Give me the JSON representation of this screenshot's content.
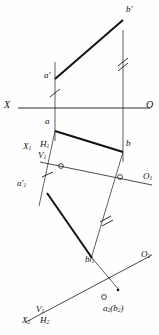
{
  "figure": {
    "type": "descriptive-geometry-projection",
    "title": "",
    "stroke_color": "#1a1a1a",
    "background_color": "#fefefe"
  },
  "axes": {
    "primary": {
      "left_label": "X",
      "right_label": "O",
      "x1": 18,
      "y1": 108,
      "x2": 150,
      "y2": 108
    },
    "aux1": {
      "origin_label": "X",
      "origin_sub": "1",
      "plane_upper": "H",
      "plane_upper_sub": "1",
      "plane_lower": "V",
      "plane_lower_sub": "1",
      "far_label": "O",
      "far_sub": "1",
      "x1": 40,
      "y1": 162,
      "x2": 152,
      "y2": 185
    },
    "aux2": {
      "origin_label": "X",
      "origin_sub": "2",
      "plane_upper": "V",
      "plane_upper_sub": "1",
      "plane_lower": "H",
      "plane_lower_sub": "2",
      "far_label": "O",
      "far_sub": "2",
      "x1": 26,
      "y1": 322,
      "x2": 152,
      "y2": 255
    }
  },
  "points": [
    {
      "id": "a-front",
      "label": "a",
      "prime": "'",
      "sub": "",
      "x": 55,
      "y": 79,
      "lx": 44,
      "ly": 72
    },
    {
      "id": "b-front",
      "label": "b",
      "prime": "'",
      "sub": "",
      "x": 123,
      "y": 20,
      "lx": 127,
      "ly": 6
    },
    {
      "id": "a-top",
      "label": "a",
      "prime": "",
      "sub": "",
      "x": 55,
      "y": 131,
      "lx": 45,
      "ly": 118
    },
    {
      "id": "b-top",
      "label": "b",
      "prime": "",
      "sub": "",
      "x": 123,
      "y": 152,
      "lx": 126,
      "ly": 140
    },
    {
      "id": "a1-aux",
      "label": "a",
      "prime": "'",
      "sub": "1",
      "x": 47,
      "y": 193,
      "lx": 20,
      "ly": 180
    },
    {
      "id": "b1-aux",
      "label": "b",
      "prime": "'",
      "sub": "1",
      "x": 92,
      "y": 258,
      "lx": 86,
      "ly": 255
    },
    {
      "id": "ab2-aux",
      "label": "a",
      "prime": "",
      "sub": "2",
      "paren_label": "b",
      "paren_sub": "2",
      "x": 113,
      "y": 295,
      "lx": 104,
      "ly": 305
    }
  ],
  "segments": [
    {
      "id": "front-view-line",
      "name": "a'b'",
      "x1": 55,
      "y1": 79,
      "x2": 123,
      "y2": 20,
      "weight": "heavy"
    },
    {
      "id": "top-view-line",
      "name": "ab",
      "x1": 55,
      "y1": 131,
      "x2": 123,
      "y2": 152,
      "weight": "heavy"
    },
    {
      "id": "aux1-view-line",
      "name": "a'1b'1",
      "x1": 47,
      "y1": 193,
      "x2": 92,
      "y2": 258,
      "weight": "heavy"
    },
    {
      "id": "projector-a-vertical",
      "name": "a-a'",
      "x1": 55,
      "y1": 62,
      "x2": 55,
      "y2": 141,
      "weight": "light"
    },
    {
      "id": "projector-b-vertical",
      "name": "b-b'",
      "x1": 123,
      "y1": 30,
      "x2": 123,
      "y2": 162,
      "weight": "light"
    },
    {
      "id": "projector-a-aux1",
      "name": "a-a'1",
      "x1": 55,
      "y1": 131,
      "x2": 39,
      "y2": 206,
      "weight": "light"
    },
    {
      "id": "projector-b-aux1",
      "name": "b-b'1",
      "x1": 123,
      "y1": 152,
      "x2": 92,
      "y2": 258,
      "weight": "light"
    },
    {
      "id": "projector-b1-aux2",
      "name": "b'1-b2",
      "x1": 92,
      "y1": 258,
      "x2": 118,
      "y2": 289,
      "weight": "light"
    }
  ],
  "tick_marks": [
    {
      "id": "tick-a-single",
      "count": 1,
      "on": "projector-a-vertical",
      "x": 55,
      "y": 93
    },
    {
      "id": "tick-b-double",
      "count": 2,
      "on": "projector-b-vertical",
      "x": 123,
      "y": 62
    },
    {
      "id": "tick-a1-single",
      "count": 1,
      "on": "projector-a-aux1",
      "x": 47,
      "y": 174
    },
    {
      "id": "tick-b1-double",
      "count": 2,
      "on": "projector-b-aux1",
      "x": 105,
      "y": 219
    }
  ],
  "markers": [
    {
      "id": "origin-circle-aux1",
      "shape": "circle",
      "x": 61,
      "y": 166
    },
    {
      "id": "origin-circle-o1",
      "shape": "circle",
      "x": 120,
      "y": 177
    },
    {
      "id": "origin-circle-aux2",
      "shape": "circle",
      "x": 104,
      "y": 297
    }
  ]
}
